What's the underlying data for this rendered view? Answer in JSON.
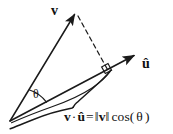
{
  "figure": {
    "width": 173,
    "height": 134,
    "background_color": "#ffffff",
    "stroke_color": "#1a1a1a",
    "text_color": "#111111"
  },
  "labels": {
    "vector_v": "v",
    "vector_u_hat": "û",
    "angle_theta": "θ"
  },
  "formula": {
    "full_text": "v · û = ‖v‖ cos(θ)",
    "lhs_v": "v",
    "dot_operator": "·",
    "lhs_u_hat": "û",
    "equals": "=",
    "norm_open": "‖",
    "norm_v": "v",
    "norm_close": "‖",
    "cos_function": "cos(",
    "cos_arg": "θ",
    "cos_close": ")"
  },
  "geometry": {
    "origin": [
      10,
      121
    ],
    "v_tip": [
      76,
      11
    ],
    "u_hat_tip": [
      137,
      53
    ],
    "projection_foot": [
      107,
      73
    ],
    "dashed_line_from": [
      75,
      16
    ],
    "dashed_line_to": [
      106,
      69
    ],
    "right_angle_marker": [
      107,
      73
    ],
    "angle_arc_label_position": [
      37,
      94
    ],
    "brace_start": [
      12,
      128
    ],
    "brace_end": [
      110,
      70
    ],
    "brace_tip": [
      73,
      108
    ]
  },
  "elements": {
    "v_arrow_name": "vector-v-arrow",
    "u_hat_arrow_name": "vector-u-hat-arrow",
    "dashed_name": "projection-dashed-line",
    "right_angle_name": "right-angle-marker",
    "arc_name": "angle-arc",
    "brace_name": "projection-brace"
  }
}
